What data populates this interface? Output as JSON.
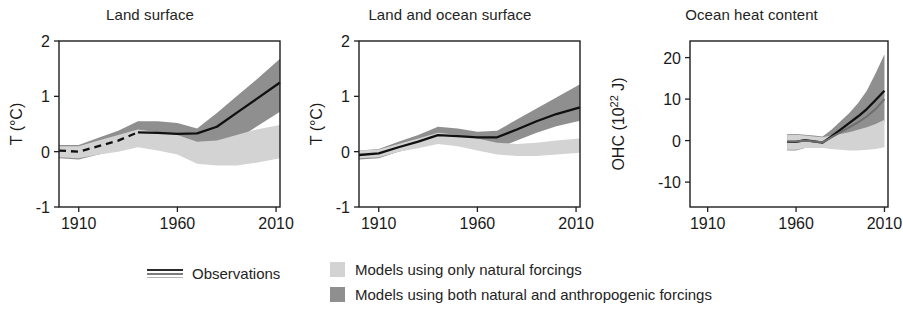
{
  "figure": {
    "background": "#ffffff",
    "colors": {
      "observations": "#101010",
      "model_natural": "#d3d3d3",
      "model_all_forcings": "#8f8f8f",
      "model_line": "#6e6e6e",
      "axis": "#1f1f1f",
      "text": "#1a1a1a"
    }
  },
  "legend": {
    "observations": {
      "label": "Observations",
      "glyph": "triple-line-glyph"
    },
    "models": [
      {
        "label": "Models using only natural forcings",
        "color": "#d3d3d3",
        "key": "natural"
      },
      {
        "label": "Models using both natural and anthropogenic forcings",
        "color": "#8f8f8f",
        "key": "anthropogenic"
      }
    ]
  },
  "chart_data": [
    {
      "type": "area",
      "id": "land-surface",
      "title": "Land surface",
      "xlabel": "",
      "ylabel": "T (°C)",
      "xlim": [
        1900,
        2012
      ],
      "ylim": [
        -1,
        2
      ],
      "xticks": [
        1910,
        1960,
        2010
      ],
      "xticklabels": [
        "1910",
        "1960",
        "2010"
      ],
      "yticks": [
        -1,
        0,
        1,
        2
      ],
      "yticklabels": [
        "-1",
        "0",
        "1",
        "2"
      ],
      "grid": false,
      "legend_position": "below-figure",
      "x": [
        1900,
        1910,
        1920,
        1930,
        1940,
        1950,
        1960,
        1970,
        1980,
        1990,
        2000,
        2012
      ],
      "series": [
        {
          "name": "Observations",
          "style": "line",
          "dashed_until": 1935,
          "values": [
            0.02,
            0.0,
            0.1,
            0.2,
            0.35,
            0.34,
            0.32,
            0.33,
            0.45,
            0.7,
            0.95,
            1.25
          ]
        },
        {
          "name": "Models using both natural and anthropogenic forcings",
          "style": "band",
          "color": "#8f8f8f",
          "lower": [
            -0.12,
            -0.14,
            -0.05,
            0.02,
            0.15,
            0.12,
            0.02,
            -0.16,
            0.0,
            0.22,
            0.45,
            0.72
          ],
          "upper": [
            0.12,
            0.12,
            0.25,
            0.38,
            0.55,
            0.55,
            0.52,
            0.42,
            0.7,
            1.0,
            1.3,
            1.68
          ]
        },
        {
          "name": "Models using only natural forcings",
          "style": "band",
          "color": "#d3d3d3",
          "lower": [
            -0.1,
            -0.12,
            -0.05,
            0.0,
            0.08,
            0.02,
            -0.05,
            -0.22,
            -0.25,
            -0.25,
            -0.2,
            -0.12
          ],
          "upper": [
            0.1,
            0.1,
            0.2,
            0.3,
            0.4,
            0.35,
            0.3,
            0.18,
            0.2,
            0.3,
            0.4,
            0.48
          ]
        }
      ]
    },
    {
      "type": "area",
      "id": "land-and-ocean-surface",
      "title": "Land and ocean surface",
      "xlabel": "",
      "ylabel": "T (°C)",
      "xlim": [
        1900,
        2012
      ],
      "ylim": [
        -1,
        2
      ],
      "xticks": [
        1910,
        1960,
        2010
      ],
      "xticklabels": [
        "1910",
        "1960",
        "2010"
      ],
      "yticks": [
        -1,
        0,
        1,
        2
      ],
      "yticklabels": [
        "-1",
        "0",
        "1",
        "2"
      ],
      "grid": false,
      "legend_position": "below-figure",
      "x": [
        1900,
        1910,
        1920,
        1930,
        1940,
        1950,
        1960,
        1970,
        1980,
        1990,
        2000,
        2012
      ],
      "series": [
        {
          "name": "Observations",
          "style": "line",
          "dashed_until": 1900,
          "values": [
            -0.06,
            -0.03,
            0.08,
            0.18,
            0.3,
            0.28,
            0.26,
            0.26,
            0.4,
            0.55,
            0.68,
            0.8
          ]
        },
        {
          "name": "Models using both natural and anthropogenic forcings",
          "style": "band",
          "color": "#8f8f8f",
          "lower": [
            -0.14,
            -0.12,
            0.0,
            0.08,
            0.18,
            0.16,
            0.08,
            0.06,
            0.2,
            0.34,
            0.46,
            0.56
          ],
          "upper": [
            0.02,
            0.05,
            0.18,
            0.3,
            0.45,
            0.42,
            0.36,
            0.38,
            0.58,
            0.78,
            0.98,
            1.22
          ]
        },
        {
          "name": "Models using only natural forcings",
          "style": "band",
          "color": "#d3d3d3",
          "lower": [
            -0.12,
            -0.1,
            0.0,
            0.06,
            0.14,
            0.1,
            0.02,
            -0.05,
            -0.08,
            -0.08,
            -0.05,
            -0.02
          ],
          "upper": [
            0.02,
            0.04,
            0.14,
            0.24,
            0.34,
            0.3,
            0.24,
            0.16,
            0.14,
            0.16,
            0.2,
            0.24
          ]
        }
      ]
    },
    {
      "type": "area",
      "id": "ocean-heat-content",
      "title": "Ocean heat content",
      "xlabel": "",
      "ylabel": "OHC (10²² J)",
      "xlim": [
        1900,
        2012
      ],
      "ylim": [
        -16,
        24
      ],
      "xticks": [
        1910,
        1960,
        2010
      ],
      "xticklabels": [
        "1910",
        "1960",
        "2010"
      ],
      "yticks": [
        -10,
        0,
        10,
        20
      ],
      "yticklabels": [
        "-10",
        "0",
        "10",
        "20"
      ],
      "grid": false,
      "legend_position": "below-figure",
      "x": [
        1955,
        1960,
        1965,
        1970,
        1975,
        1980,
        1985,
        1990,
        1995,
        2000,
        2005,
        2010
      ],
      "series": [
        {
          "name": "Observations",
          "style": "line",
          "dashed_until": 1955,
          "values": [
            -0.3,
            -0.3,
            0.1,
            -0.2,
            -0.5,
            1.0,
            2.6,
            4.2,
            5.8,
            7.6,
            9.8,
            12.0
          ]
        },
        {
          "name": "Models using both natural and anthropogenic forcings",
          "style": "band",
          "color": "#8f8f8f",
          "lower": [
            -2.4,
            -2.4,
            -1.8,
            -1.6,
            -1.4,
            -0.6,
            0.4,
            1.2,
            2.0,
            2.8,
            3.6,
            4.4
          ],
          "upper": [
            1.6,
            1.6,
            1.4,
            1.2,
            1.0,
            2.6,
            4.6,
            6.6,
            9.0,
            12.0,
            16.2,
            20.8
          ]
        },
        {
          "name": "Models using only natural forcings",
          "style": "band",
          "color": "#d3d3d3",
          "lower": [
            -2.2,
            -2.2,
            -1.8,
            -1.8,
            -1.8,
            -2.0,
            -2.2,
            -2.4,
            -2.4,
            -2.2,
            -2.0,
            -1.6
          ],
          "upper": [
            1.4,
            1.4,
            1.2,
            1.0,
            0.8,
            1.2,
            1.6,
            2.0,
            2.6,
            3.2,
            4.0,
            5.0
          ]
        },
        {
          "name": "Model ensemble mean",
          "style": "line",
          "color": "#6e6e6e",
          "values": [
            -0.2,
            -0.2,
            0.0,
            -0.2,
            -0.4,
            0.8,
            2.0,
            3.2,
            4.4,
            5.8,
            7.6,
            10.0
          ]
        }
      ]
    }
  ]
}
